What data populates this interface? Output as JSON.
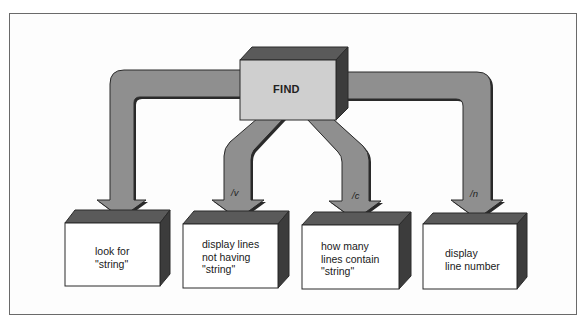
{
  "diagram": {
    "title": "FIND",
    "center_node": {
      "label": "FIND"
    },
    "branches": [
      {
        "switch": "",
        "lines": [
          "look for",
          "\"string\""
        ]
      },
      {
        "switch": "/v",
        "lines": [
          "display lines",
          "not having",
          "\"string\""
        ]
      },
      {
        "switch": "/c",
        "lines": [
          "how many",
          "lines contain",
          "\"string\""
        ]
      },
      {
        "switch": "/n",
        "lines": [
          "display",
          "line number"
        ]
      }
    ],
    "colors": {
      "arrow_fill": "#8f8f8f",
      "arrow_outline": "#2a2a2a",
      "box_front": "#ffffff",
      "box_top": "#5a5a5a",
      "box_side": "#3c3c3c",
      "find_front": "#cfcfcf"
    }
  }
}
